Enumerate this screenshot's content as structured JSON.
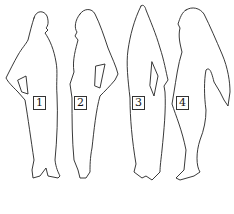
{
  "diagram": {
    "type": "silhouette-outlines",
    "figures": [
      {
        "id": "figure-1",
        "label": "1",
        "pose": "standing, facing right, hand on hip"
      },
      {
        "id": "figure-2",
        "label": "2",
        "pose": "standing, facing left, hand on hip"
      },
      {
        "id": "figure-3",
        "label": "3",
        "pose": "standing, tall pointed headdress"
      },
      {
        "id": "figure-4",
        "label": "4",
        "pose": "standing, facing left, long hanging sleeve"
      }
    ],
    "colors": {
      "stroke": "#222222",
      "background": "#ffffff",
      "label_border": "#333333"
    }
  }
}
